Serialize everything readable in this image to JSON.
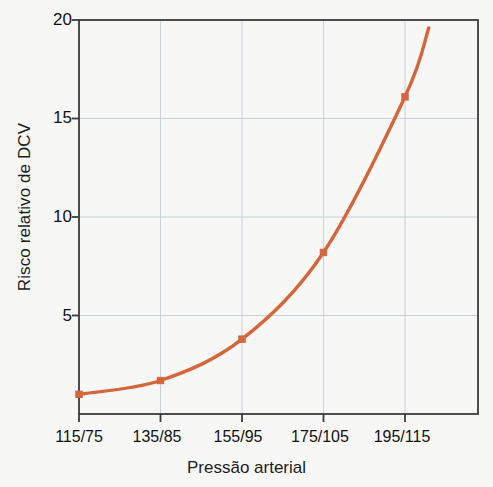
{
  "chart_data": {
    "type": "line",
    "title": "",
    "subtitle": "",
    "xlabel": "Pressão arterial",
    "ylabel": "Risco relativo de DCV",
    "categories": [
      "115/75",
      "135/85",
      "155/95",
      "175/105",
      "195/115"
    ],
    "values": [
      1.0,
      1.7,
      3.8,
      8.2,
      16.1
    ],
    "series": [
      {
        "name": "Risco relativo de DCV",
        "values": [
          1.0,
          1.7,
          3.8,
          8.2,
          16.1
        ],
        "color": "#d4663c",
        "marker": "square",
        "line_extends_beyond_last_point_to": 19.6
      }
    ],
    "ylim": [
      0,
      20
    ],
    "yticks": [
      5,
      10,
      15,
      20
    ],
    "ytick_labels": [
      "5",
      "10",
      "15",
      "20"
    ],
    "xtick_labels": [
      "115/75",
      "135/85",
      "155/95",
      "175/105",
      "195/115"
    ],
    "grid": true,
    "grid_color": "#c8d0d8",
    "legend": null,
    "legend_position": "none",
    "frame_color": "#3a3a3a",
    "background_color": "#f7f7f5",
    "annotations": []
  },
  "axes": {
    "y_title": "Risco relativo de DCV",
    "x_title": "Pressão arterial",
    "y_ticks": [
      {
        "label": "20",
        "value": 20
      },
      {
        "label": "15",
        "value": 15
      },
      {
        "label": "10",
        "value": 10
      },
      {
        "label": "5",
        "value": 5
      }
    ],
    "x_ticks": [
      {
        "label": "115/75"
      },
      {
        "label": "135/85"
      },
      {
        "label": "155/95"
      },
      {
        "label": "175/105"
      },
      {
        "label": "195/115"
      }
    ]
  },
  "colors": {
    "line": "#d4663c",
    "grid": "#c8d0d8",
    "frame": "#3a3a3a",
    "background": "#f7f7f5",
    "text": "#111111"
  }
}
